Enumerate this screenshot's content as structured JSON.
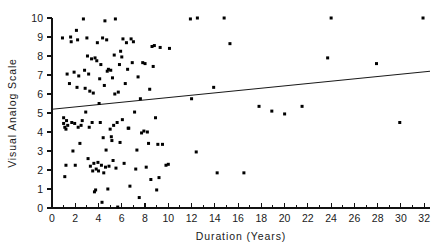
{
  "chart_data": {
    "type": "scatter",
    "title": "",
    "xlabel": "Duration  (Years)",
    "ylabel": "Visual  Analog  Scale",
    "xlim": [
      0,
      32.5
    ],
    "ylim": [
      0,
      10
    ],
    "grid": false,
    "legend": "none",
    "x_ticks": [
      0,
      2,
      4,
      6,
      8,
      10,
      12,
      14,
      16,
      18,
      20,
      22,
      24,
      26,
      28,
      30,
      32
    ],
    "x_tick_labels": [
      "0",
      "2",
      "4",
      "6",
      "8",
      "10",
      "12",
      "14",
      "16",
      "18",
      "20",
      "22",
      "24",
      "26",
      "28",
      "30",
      "32"
    ],
    "x_minor_interval": 1,
    "y_ticks": [
      0,
      1,
      2,
      3,
      4,
      5,
      6,
      7,
      8,
      9,
      10
    ],
    "y_tick_labels": [
      "0",
      "1",
      "2",
      "3",
      "4",
      "5",
      "6",
      "7",
      "8",
      "9",
      "10"
    ],
    "marker": "filled-square",
    "marker_size_px": 3,
    "marker_color": "#000000",
    "trendline": {
      "type": "linear",
      "x_start": 0,
      "y_start": 5.2,
      "x_end": 32.5,
      "y_end": 7.2,
      "color": "#1a1a1a"
    },
    "points": [
      [
        0.9,
        8.95
      ],
      [
        1.0,
        4.75
      ],
      [
        1.0,
        4.45
      ],
      [
        1.1,
        4.25
      ],
      [
        1.1,
        1.65
      ],
      [
        1.2,
        4.15
      ],
      [
        1.2,
        2.25
      ],
      [
        1.25,
        4.6
      ],
      [
        1.3,
        7.05
      ],
      [
        1.35,
        4.35
      ],
      [
        1.5,
        6.55
      ],
      [
        1.6,
        9.0
      ],
      [
        1.65,
        8.75
      ],
      [
        1.7,
        4.5
      ],
      [
        1.8,
        3.0
      ],
      [
        1.9,
        7.15
      ],
      [
        1.95,
        4.45
      ],
      [
        2.0,
        2.25
      ],
      [
        2.1,
        9.35
      ],
      [
        2.15,
        6.35
      ],
      [
        2.2,
        8.85
      ],
      [
        2.25,
        4.25
      ],
      [
        2.3,
        6.95
      ],
      [
        2.4,
        3.4
      ],
      [
        2.5,
        4.35
      ],
      [
        2.6,
        4.6
      ],
      [
        2.7,
        9.95
      ],
      [
        2.8,
        7.25
      ],
      [
        2.85,
        6.3
      ],
      [
        2.9,
        5.05
      ],
      [
        3.0,
        8.95
      ],
      [
        3.05,
        8.0
      ],
      [
        3.1,
        2.6
      ],
      [
        3.15,
        7.05
      ],
      [
        3.2,
        4.25
      ],
      [
        3.25,
        6.15
      ],
      [
        3.3,
        2.2
      ],
      [
        3.4,
        7.85
      ],
      [
        3.45,
        4.5
      ],
      [
        3.5,
        1.95
      ],
      [
        3.55,
        6.05
      ],
      [
        3.6,
        2.35
      ],
      [
        3.65,
        0.85
      ],
      [
        3.7,
        7.9
      ],
      [
        3.75,
        0.95
      ],
      [
        3.8,
        2.05
      ],
      [
        3.85,
        7.75
      ],
      [
        3.9,
        8.7
      ],
      [
        3.95,
        2.4
      ],
      [
        4.0,
        1.95
      ],
      [
        4.05,
        5.5
      ],
      [
        4.1,
        6.8
      ],
      [
        4.15,
        4.5
      ],
      [
        4.2,
        7.55
      ],
      [
        4.25,
        2.25
      ],
      [
        4.3,
        0.3
      ],
      [
        4.35,
        8.95
      ],
      [
        4.4,
        3.7
      ],
      [
        4.45,
        1.85
      ],
      [
        4.5,
        6.45
      ],
      [
        4.55,
        9.85
      ],
      [
        4.6,
        2.15
      ],
      [
        4.65,
        3.05
      ],
      [
        4.7,
        8.85
      ],
      [
        4.75,
        7.2
      ],
      [
        4.8,
        1.0
      ],
      [
        4.85,
        7.3
      ],
      [
        4.9,
        2.2
      ],
      [
        5.0,
        4.15
      ],
      [
        5.05,
        7.25
      ],
      [
        5.1,
        3.75
      ],
      [
        5.15,
        3.55
      ],
      [
        5.2,
        6.85
      ],
      [
        5.25,
        2.5
      ],
      [
        5.3,
        4.35
      ],
      [
        5.35,
        8.05
      ],
      [
        5.4,
        6.0
      ],
      [
        5.45,
        9.95
      ],
      [
        5.5,
        2.1
      ],
      [
        5.6,
        4.5
      ],
      [
        5.65,
        0.05
      ],
      [
        5.7,
        6.1
      ],
      [
        5.8,
        7.55
      ],
      [
        5.85,
        3.45
      ],
      [
        5.9,
        8.25
      ],
      [
        6.0,
        7.95
      ],
      [
        6.05,
        4.65
      ],
      [
        6.1,
        8.9
      ],
      [
        6.2,
        2.35
      ],
      [
        6.3,
        6.55
      ],
      [
        6.4,
        8.7
      ],
      [
        6.5,
        7.3
      ],
      [
        6.55,
        4.2
      ],
      [
        6.6,
        4.2
      ],
      [
        6.7,
        1.15
      ],
      [
        6.8,
        8.9
      ],
      [
        6.9,
        7.65
      ],
      [
        7.0,
        8.75
      ],
      [
        7.1,
        5.05
      ],
      [
        7.2,
        2.05
      ],
      [
        7.3,
        3.05
      ],
      [
        7.4,
        6.9
      ],
      [
        7.5,
        0.55
      ],
      [
        7.6,
        5.75
      ],
      [
        7.7,
        3.95
      ],
      [
        7.8,
        7.65
      ],
      [
        7.9,
        4.05
      ],
      [
        8.0,
        7.6
      ],
      [
        8.1,
        2.15
      ],
      [
        8.2,
        4.0
      ],
      [
        8.3,
        3.4
      ],
      [
        8.4,
        6.25
      ],
      [
        8.5,
        1.5
      ],
      [
        8.6,
        8.5
      ],
      [
        8.7,
        7.45
      ],
      [
        8.8,
        8.55
      ],
      [
        8.9,
        4.75
      ],
      [
        9.0,
        0.95
      ],
      [
        9.1,
        3.35
      ],
      [
        9.2,
        1.6
      ],
      [
        9.3,
        8.45
      ],
      [
        9.5,
        3.35
      ],
      [
        9.8,
        2.25
      ],
      [
        10.0,
        2.3
      ],
      [
        10.1,
        8.4
      ],
      [
        11.9,
        9.95
      ],
      [
        12.0,
        5.75
      ],
      [
        12.4,
        2.95
      ],
      [
        12.5,
        10.0
      ],
      [
        13.9,
        6.35
      ],
      [
        14.2,
        1.85
      ],
      [
        14.8,
        10.0
      ],
      [
        15.3,
        8.65
      ],
      [
        16.5,
        1.85
      ],
      [
        17.8,
        5.35
      ],
      [
        18.9,
        5.1
      ],
      [
        20.0,
        4.95
      ],
      [
        21.5,
        5.35
      ],
      [
        23.7,
        7.9
      ],
      [
        24.0,
        10.0
      ],
      [
        27.9,
        7.6
      ],
      [
        29.9,
        4.5
      ],
      [
        31.9,
        10.0
      ]
    ]
  },
  "axes": {
    "x_title": "Duration  (Years)",
    "y_title": "Visual  Analog  Scale"
  }
}
